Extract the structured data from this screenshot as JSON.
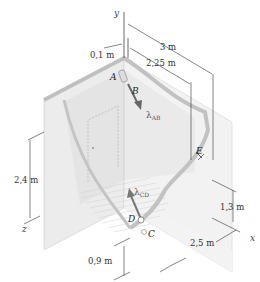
{
  "figure": {
    "axes": {
      "x": "x",
      "y": "y",
      "z": "z"
    },
    "points": {
      "A": "A",
      "B": "B",
      "C": "C",
      "D": "D",
      "E": "E"
    },
    "vectors": {
      "ab": {
        "symbol": "λ",
        "subscript": "AB"
      },
      "cd": {
        "symbol": "λ",
        "subscript": "CD"
      }
    },
    "dimensions": {
      "offset": "0,1 m",
      "top_long": "3 m",
      "top_short": "2,25 m",
      "left_height": "2,4 m",
      "right_height": "1,3 m",
      "bottom_width": "2,5 m",
      "bottom_height": "0,9 m"
    },
    "colors": {
      "wall_light": "#eeeeee",
      "wall_mid": "#e2e2e2",
      "floor": "#f0f0f0",
      "cable": "#9a9a9a",
      "dim_line": "#333333"
    }
  }
}
